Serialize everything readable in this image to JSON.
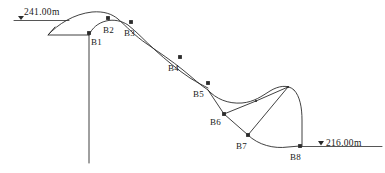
{
  "diagram": {
    "stroke_color": "#2b2b2b",
    "text_color": "#1a1a1a",
    "background": "#ffffff",
    "elevation_markers": [
      {
        "id": "elev-top",
        "symbol": "▽",
        "value": "241.00",
        "unit": "m",
        "text": "241.00m",
        "x": 14,
        "y": 8
      },
      {
        "id": "elev-bottom",
        "symbol": "▽",
        "value": "216.00",
        "unit": "m",
        "text": "216.00m",
        "x": 316,
        "y": 139
      }
    ],
    "points": [
      {
        "label": "B1",
        "x": 89,
        "y": 33,
        "lx": 91,
        "ly": 38
      },
      {
        "label": "B2",
        "x": 108,
        "y": 18,
        "lx": 103,
        "ly": 26
      },
      {
        "label": "B3",
        "x": 131,
        "y": 22,
        "lx": 124,
        "ly": 29
      },
      {
        "label": "B4",
        "x": 180,
        "y": 57,
        "lx": 168,
        "ly": 64
      },
      {
        "label": "B5",
        "x": 208,
        "y": 83,
        "lx": 193,
        "ly": 90
      },
      {
        "label": "B6",
        "x": 224,
        "y": 114,
        "lx": 210,
        "ly": 118
      },
      {
        "label": "B7",
        "x": 248,
        "y": 135,
        "lx": 236,
        "ly": 142
      },
      {
        "label": "B8",
        "x": 300,
        "y": 146,
        "lx": 290,
        "ly": 153
      }
    ],
    "ground_surface_label": "ground-surface-curve",
    "slip_surface_label": "slip-surface-curve",
    "boreholes_label": "borehole-markers"
  }
}
